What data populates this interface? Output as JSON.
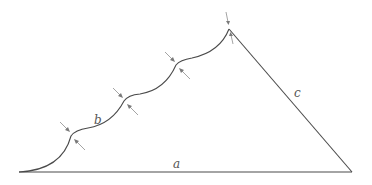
{
  "diagram": {
    "type": "geometric-figure",
    "labels": {
      "a": "a",
      "b": "b",
      "c": "c"
    },
    "colors": {
      "stroke": "#4a4a4a",
      "arrow": "#9a9a9a",
      "label": "#555555",
      "background": "#ffffff"
    },
    "points": {
      "base_left": [
        19,
        172
      ],
      "base_right": [
        352,
        172
      ],
      "cusp_1": [
        71,
        136
      ],
      "cusp_2": [
        124,
        101
      ],
      "cusp_3": [
        176,
        65
      ],
      "apex": [
        229,
        29
      ]
    },
    "cusp_count": 3,
    "arrow_pairs": 4
  }
}
